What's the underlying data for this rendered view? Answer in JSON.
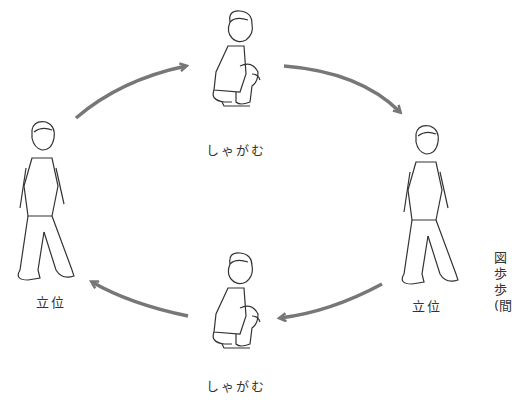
{
  "diagram": {
    "nodes": [
      {
        "id": "squat-top",
        "label": "しゃがむ",
        "pose": "squatting"
      },
      {
        "id": "stand-right",
        "label": "立位",
        "pose": "standing"
      },
      {
        "id": "squat-bottom",
        "label": "しゃがむ",
        "pose": "squatting"
      },
      {
        "id": "stand-left",
        "label": "立位",
        "pose": "standing"
      }
    ],
    "edges": [
      {
        "from": "stand-left",
        "to": "squat-top"
      },
      {
        "from": "squat-top",
        "to": "stand-right"
      },
      {
        "from": "stand-right",
        "to": "squat-bottom"
      },
      {
        "from": "squat-bottom",
        "to": "stand-left"
      }
    ],
    "arrow_color": "#777777",
    "caption_lines": [
      "図",
      "歩",
      "歩",
      "(間"
    ]
  }
}
